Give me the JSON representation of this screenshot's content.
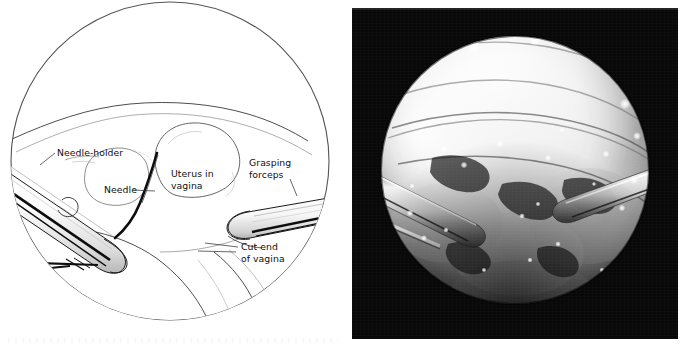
{
  "figure": {
    "type": "two-panel surgical figure",
    "background_color": "#ffffff",
    "panels": [
      {
        "id": "drawing",
        "kind": "line-drawing",
        "shape": "circle"
      },
      {
        "id": "photograph",
        "kind": "laparoscopic-photograph",
        "shape": "circle-on-black-square"
      }
    ]
  },
  "drawing": {
    "title": "Laparoscopic vaginal vault closure",
    "view_shape": "circular laparoscopic field of view",
    "line_color": "#1a1a1a",
    "fill_color": "#ffffff",
    "labels": [
      {
        "id": "needle-holder",
        "text": "Needle-holder"
      },
      {
        "id": "needle",
        "text": "Needle"
      },
      {
        "id": "uterus",
        "line1": "Uterus in",
        "line2": "vagina"
      },
      {
        "id": "forceps",
        "line1": "Grasping",
        "line2": "forceps"
      },
      {
        "id": "cut-end",
        "line1": "Cut end",
        "line2": "of vagina"
      }
    ],
    "instruments": [
      {
        "id": "needle-holder-shaft",
        "label": "Needle-holder",
        "enters_from": "lower-left"
      },
      {
        "id": "grasping-forceps-shaft",
        "label": "Grasping forceps",
        "enters_from": "right"
      },
      {
        "id": "suture-needle",
        "label": "Needle",
        "position": "center"
      }
    ],
    "anatomy": [
      {
        "id": "uterus-in-vagina",
        "label": "Uterus in vagina"
      },
      {
        "id": "cut-end-of-vagina",
        "label": "Cut end of vagina"
      },
      {
        "id": "pelvic-sidewall",
        "label": "pelvic peritoneum"
      }
    ]
  },
  "photograph": {
    "description": "Intra-operative laparoscopic view, grayscale",
    "border_color": "#0a0a0a",
    "field_shape": "circle",
    "tone": "monochrome grayscale, overexposed upper field",
    "visible_elements": [
      "needle-holder shaft entering from lower left",
      "grasping forceps entering from right",
      "vaginal vault tissue",
      "bright specular highlights"
    ]
  }
}
